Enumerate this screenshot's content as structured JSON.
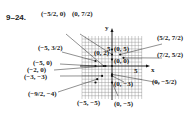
{
  "exercise_label": "9–24.",
  "axes": {
    "x_label": "x",
    "y_label": "y",
    "x_tick": "5",
    "y_tick": "5"
  },
  "points": [
    {
      "label": "(−5/2, 0)",
      "x": -2.5,
      "y": 0
    },
    {
      "label": "(0, 7/2)",
      "x": 0,
      "y": 3.5
    },
    {
      "label": "(−5, 3/2)",
      "x": -5,
      "y": 1.5
    },
    {
      "label": "(5/2, 7/2)",
      "x": 2.5,
      "y": 3.5
    },
    {
      "label": "(7/2, 5/2)",
      "x": 3.5,
      "y": 2.5
    },
    {
      "label": "(0, 5)",
      "x": 0,
      "y": 5
    },
    {
      "label": "(0, 2)",
      "x": 0,
      "y": 2
    },
    {
      "label": "(0, 0)",
      "x": 0,
      "y": 0
    },
    {
      "label": "(−5, 0)",
      "x": -5,
      "y": 0
    },
    {
      "label": "(−2, 0)",
      "x": -2,
      "y": 0
    },
    {
      "label": "(−3, −3)",
      "x": -3,
      "y": -3
    },
    {
      "label": "(−9/2, −4)",
      "x": -4.5,
      "y": -4
    },
    {
      "label": "(−5, −5)",
      "x": -5,
      "y": -5
    },
    {
      "label": "(0, −3)",
      "x": 0,
      "y": -3
    },
    {
      "label": "(0, −5)",
      "x": 0,
      "y": -5
    },
    {
      "label": "(0, −5/2)",
      "x": 0,
      "y": -2.5
    }
  ]
}
